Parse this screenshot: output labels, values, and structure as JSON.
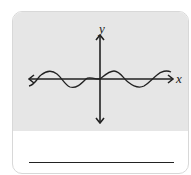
{
  "figure": {
    "axis_labels": {
      "x": "x",
      "y": "y"
    },
    "curve": {
      "type": "sine",
      "description": "periodic wave through origin",
      "color": "#222222"
    },
    "colors": {
      "plot_background": "#e6e6e6",
      "card_background": "#ffffff",
      "stroke": "#222222"
    }
  },
  "answer": {
    "value": ""
  }
}
